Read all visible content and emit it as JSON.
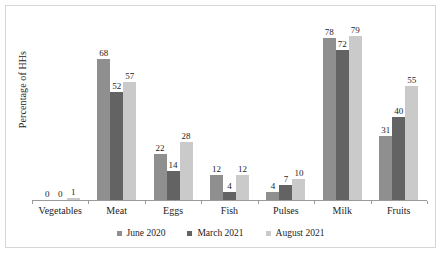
{
  "chart_data": {
    "type": "bar",
    "title": "",
    "xlabel": "",
    "ylabel": "Percentage of HHs",
    "ylim": [
      0,
      90
    ],
    "grid": false,
    "legend_position": "bottom",
    "categories": [
      "Vegetables",
      "Meat",
      "Eggs",
      "Fish",
      "Pulses",
      "Milk",
      "Fruits"
    ],
    "series": [
      {
        "name": "June 2020",
        "color": "#8f8f8f",
        "values": [
          0,
          68,
          22,
          12,
          4,
          78,
          31
        ]
      },
      {
        "name": "March 2021",
        "color": "#636363",
        "values": [
          0,
          52,
          14,
          4,
          7,
          72,
          40
        ]
      },
      {
        "name": "August 2021",
        "color": "#cacaca",
        "values": [
          1,
          57,
          28,
          12,
          10,
          79,
          55
        ]
      }
    ],
    "data_labels": [
      [
        "0",
        "0",
        "1"
      ],
      [
        "68",
        "52",
        "57"
      ],
      [
        "22",
        "14",
        "28"
      ],
      [
        "12",
        "4",
        "12"
      ],
      [
        "4",
        "7",
        "10"
      ],
      [
        "78",
        "72",
        "79"
      ],
      [
        "31",
        "40",
        "55"
      ]
    ]
  }
}
